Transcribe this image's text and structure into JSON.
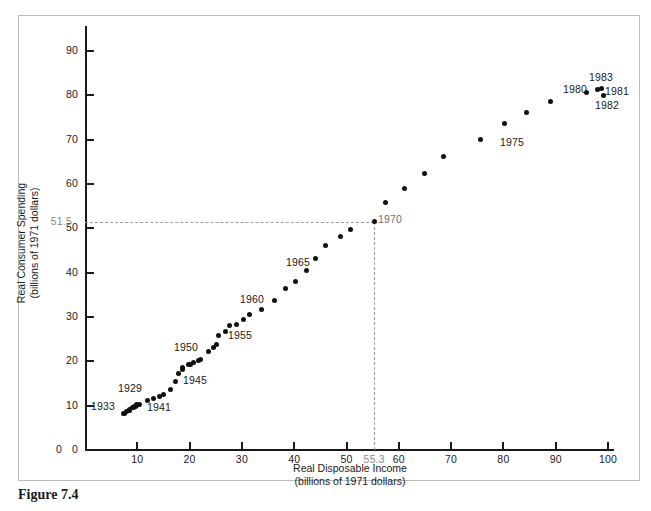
{
  "caption": "Figure 7.4",
  "chart_data": {
    "type": "scatter",
    "title": "",
    "xlabel": "Real Disposable Income",
    "xlabel_sub": "(billions of 1971 dollars)",
    "ylabel": "Real Consumer Spending",
    "ylabel_sub": "(billions of 1971 dollars)",
    "xlim": [
      0,
      104
    ],
    "ylim": [
      0,
      95
    ],
    "grid": false,
    "legend": "none",
    "xticks": [
      0,
      10,
      20,
      30,
      40,
      50,
      60,
      70,
      80,
      90,
      100
    ],
    "yticks": [
      0,
      10,
      20,
      30,
      40,
      50,
      60,
      70,
      80,
      90
    ],
    "special_ticks": {
      "x": {
        "value": 55.3,
        "label": "55.3"
      },
      "y": {
        "value": 51.5,
        "label": "51.5"
      }
    },
    "guide_lines": {
      "horizontal_y": 51.5,
      "vertical_x": 55.3,
      "description": "dashed lines marking the 1970 observation"
    },
    "points": [
      {
        "year": 1929,
        "x": 9.8,
        "y": 10.2
      },
      {
        "year": 1930,
        "x": 9.0,
        "y": 9.5
      },
      {
        "year": 1931,
        "x": 8.5,
        "y": 9.1
      },
      {
        "year": 1932,
        "x": 7.6,
        "y": 8.3
      },
      {
        "year": 1933,
        "x": 7.4,
        "y": 8.2
      },
      {
        "year": 1934,
        "x": 8.0,
        "y": 8.6
      },
      {
        "year": 1935,
        "x": 8.6,
        "y": 9.0
      },
      {
        "year": 1936,
        "x": 9.4,
        "y": 9.7
      },
      {
        "year": 1937,
        "x": 9.7,
        "y": 9.9
      },
      {
        "year": 1938,
        "x": 9.2,
        "y": 9.5
      },
      {
        "year": 1939,
        "x": 9.9,
        "y": 10.0
      },
      {
        "year": 1940,
        "x": 10.4,
        "y": 10.3
      },
      {
        "year": 1941,
        "x": 11.9,
        "y": 11.1
      },
      {
        "year": 1942,
        "x": 13.1,
        "y": 11.5
      },
      {
        "year": 1943,
        "x": 14.2,
        "y": 12.0
      },
      {
        "year": 1944,
        "x": 15.1,
        "y": 12.6
      },
      {
        "year": 1945,
        "x": 16.4,
        "y": 13.7
      },
      {
        "year": 1946,
        "x": 17.3,
        "y": 15.4
      },
      {
        "year": 1947,
        "x": 17.9,
        "y": 17.3
      },
      {
        "year": 1948,
        "x": 18.6,
        "y": 18.2
      },
      {
        "year": 1949,
        "x": 18.7,
        "y": 18.6
      },
      {
        "year": 1950,
        "x": 19.8,
        "y": 19.3
      },
      {
        "year": 1951,
        "x": 20.2,
        "y": 19.2
      },
      {
        "year": 1952,
        "x": 20.8,
        "y": 19.7
      },
      {
        "year": 1953,
        "x": 21.7,
        "y": 20.2
      },
      {
        "year": 1954,
        "x": 22.1,
        "y": 20.3
      },
      {
        "year": 1955,
        "x": 23.6,
        "y": 22.1
      },
      {
        "year": 1956,
        "x": 24.5,
        "y": 23.2
      },
      {
        "year": 1957,
        "x": 25.1,
        "y": 23.9
      },
      {
        "year": 1958,
        "x": 25.5,
        "y": 25.9
      },
      {
        "year": 1959,
        "x": 26.9,
        "y": 26.8
      },
      {
        "year": 1960,
        "x": 27.6,
        "y": 28.1
      },
      {
        "year": 1961,
        "x": 28.9,
        "y": 28.4
      },
      {
        "year": 1962,
        "x": 30.3,
        "y": 29.5
      },
      {
        "year": 1963,
        "x": 31.4,
        "y": 30.5
      },
      {
        "year": 1964,
        "x": 33.8,
        "y": 31.6
      },
      {
        "year": 1965,
        "x": 36.2,
        "y": 33.8
      },
      {
        "year": 1966,
        "x": 38.3,
        "y": 36.5
      },
      {
        "year": 1967,
        "x": 40.3,
        "y": 38.0
      },
      {
        "year": 1968,
        "x": 42.4,
        "y": 40.5
      },
      {
        "year": 1969,
        "x": 44.0,
        "y": 43.2
      },
      {
        "year": 1970,
        "x": 46.0,
        "y": 46.0
      },
      {
        "year": 1971,
        "x": 48.8,
        "y": 48.1
      },
      {
        "year": 1972,
        "x": 50.8,
        "y": 49.8
      },
      {
        "year": 1973,
        "x": 55.3,
        "y": 51.5
      },
      {
        "year": 1974,
        "x": 57.4,
        "y": 55.7
      },
      {
        "year": 1975,
        "x": 61.0,
        "y": 58.9
      },
      {
        "year": 1976,
        "x": 64.9,
        "y": 62.3
      },
      {
        "year": 1977,
        "x": 68.6,
        "y": 66.1
      },
      {
        "year": 1978,
        "x": 75.6,
        "y": 70.0
      },
      {
        "year": 1979,
        "x": 80.3,
        "y": 73.6
      },
      {
        "year": 1980,
        "x": 84.4,
        "y": 76.1
      },
      {
        "year": 1981,
        "x": 89.0,
        "y": 78.6
      },
      {
        "year": 1982,
        "x": 95.9,
        "y": 80.6
      },
      {
        "year": 1983,
        "x": 97.9,
        "y": 81.3
      },
      {
        "year": 1984,
        "x": 98.8,
        "y": 81.6
      },
      {
        "year": 1985,
        "x": 99.1,
        "y": 79.9
      }
    ],
    "annotations": [
      {
        "label": "1933",
        "x_px": 91,
        "y_px": 400,
        "gray": false
      },
      {
        "label": "1929",
        "x_px": 118,
        "y_px": 382,
        "gray": false
      },
      {
        "label": "1941",
        "x_px": 147,
        "y_px": 401,
        "gray": false
      },
      {
        "label": "1945",
        "x_px": 183,
        "y_px": 374,
        "gray": false
      },
      {
        "label": "1950",
        "x_px": 174,
        "y_px": 341,
        "gray": false
      },
      {
        "label": "1955",
        "x_px": 228,
        "y_px": 329,
        "gray": false
      },
      {
        "label": "1960",
        "x_px": 240,
        "y_px": 293,
        "gray": false
      },
      {
        "label": "1965",
        "x_px": 286,
        "y_px": 256,
        "gray": false
      },
      {
        "label": "1970",
        "x_px": 378,
        "y_px": 213,
        "gray": true
      },
      {
        "label": "1975",
        "x_px": 500,
        "y_px": 136,
        "gray": false
      },
      {
        "label": "1980",
        "x_px": 563,
        "y_px": 83,
        "gray": false
      },
      {
        "label": "1983",
        "x_px": 589,
        "y_px": 71,
        "gray": false
      },
      {
        "label": "1981",
        "x_px": 605,
        "y_px": 85,
        "gray": false
      },
      {
        "label": "1982",
        "x_px": 595,
        "y_px": 99,
        "gray": false
      }
    ]
  }
}
